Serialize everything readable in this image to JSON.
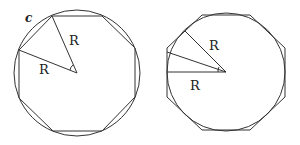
{
  "diagrams": {
    "inscribed": {
      "circle_label": "c",
      "radius_label_1": "R",
      "radius_label_2": "R"
    },
    "circumscribed": {
      "radius_label_1": "R",
      "radius_label_2": "R"
    }
  },
  "colors": {
    "stroke": "#333333",
    "background": "#ffffff"
  }
}
